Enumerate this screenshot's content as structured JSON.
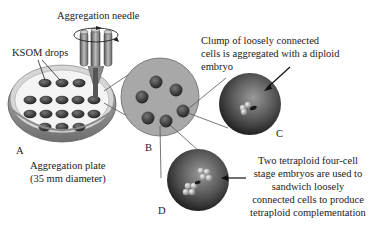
{
  "diagram": {
    "labels": {
      "needle": "Aggregation needle",
      "drops": "KSOM drops",
      "plate_line1": "Aggregation plate",
      "plate_line2": "(35 mm diameter)",
      "clump_line1": "Clump of loosely connected",
      "clump_line2": "cells is aggregated with a diploid",
      "clump_line3": "embryo",
      "tetra_line1": "Two tetraploid four-cell",
      "tetra_line2": "stage embryos are used to",
      "tetra_line3": "sandwich loosely",
      "tetra_line4": "connected cells to produce",
      "tetra_line5": "tetraploid complementation"
    },
    "panels": [
      "A",
      "B",
      "C",
      "D"
    ],
    "colors": {
      "drop": "#3a3a3a",
      "plate_rim": "#9a9a9a",
      "well_disc": "#a6a6a6",
      "embryo_dark": "#2e2e2e",
      "embryo_light": "#8c8c8c"
    }
  }
}
